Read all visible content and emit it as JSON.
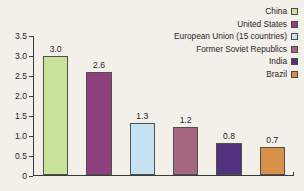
{
  "chart_data": {
    "type": "bar",
    "title": "",
    "subtitle": "",
    "xlabel": "",
    "ylabel": "",
    "ylim": [
      0,
      3.5
    ],
    "yticks": [
      "0",
      "0.5",
      "1.0",
      "1.5",
      "2.0",
      "2.5",
      "3.0",
      "3.5"
    ],
    "ytick_values": [
      0,
      0.5,
      1.0,
      1.5,
      2.0,
      2.5,
      3.0,
      3.5
    ],
    "grid": false,
    "legend_position": "top-right",
    "categories": [
      "China",
      "United States",
      "European Union (15 countries)",
      "Former Soviet Republics",
      "India",
      "Brazil"
    ],
    "values": [
      3.0,
      2.6,
      1.3,
      1.2,
      0.8,
      0.7
    ],
    "value_labels": [
      "3.0",
      "2.6",
      "1.3",
      "1.2",
      "0.8",
      "0.7"
    ],
    "colors": [
      "#c9e39a",
      "#8e3f7e",
      "#c5e3f5",
      "#a5677f",
      "#54317f",
      "#d99049"
    ],
    "bar_edge_color": "#4f4f4f",
    "axis_color": "#3a3a3a",
    "background_color": "#f3f0ea",
    "bars": [
      {
        "label": "China",
        "value": 3.0,
        "value_label": "3.0",
        "color": "#c9e39a"
      },
      {
        "label": "United States",
        "value": 2.6,
        "value_label": "2.6",
        "color": "#8e3f7e"
      },
      {
        "label": "European Union (15 countries)",
        "value": 1.3,
        "value_label": "1.3",
        "color": "#c5e3f5"
      },
      {
        "label": "Former Soviet Republics",
        "value": 1.2,
        "value_label": "1.2",
        "color": "#a5677f"
      },
      {
        "label": "India",
        "value": 0.8,
        "value_label": "0.8",
        "color": "#54317f"
      },
      {
        "label": "Brazil",
        "value": 0.7,
        "value_label": "0.7",
        "color": "#d99049"
      }
    ],
    "legend": [
      {
        "label": "China",
        "color": "#c9e39a"
      },
      {
        "label": "United States",
        "color": "#8e3f7e"
      },
      {
        "label": "European Union (15 countries)",
        "color": "#c5e3f5"
      },
      {
        "label": "Former Soviet Republics",
        "color": "#a5677f"
      },
      {
        "label": "India",
        "color": "#54317f"
      },
      {
        "label": "Brazil",
        "color": "#d99049"
      }
    ]
  }
}
